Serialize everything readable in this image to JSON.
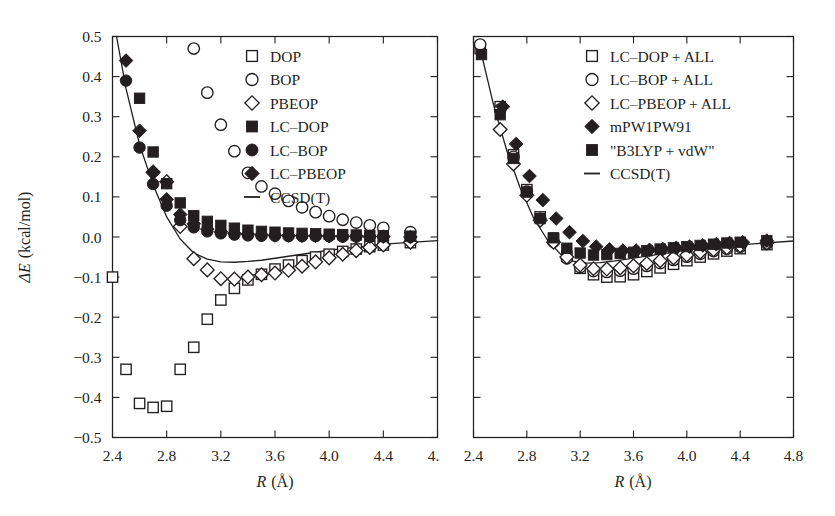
{
  "figure": {
    "background": "#ffffff",
    "ink": "#231f20",
    "panels": [
      "left",
      "right"
    ]
  },
  "chart_data": [
    {
      "id": "left",
      "type": "scatter",
      "title": "",
      "xlabel": "R (Å)",
      "ylabel": "ΔE (kcal/mol)",
      "xlim": [
        2.4,
        4.8
      ],
      "ylim": [
        -0.5,
        0.5
      ],
      "xticks": [
        "2.4",
        "2.8",
        "3.2",
        "3.6",
        "4.0",
        "4.4",
        "4.8"
      ],
      "xtick_values": [
        2.4,
        2.8,
        3.2,
        3.6,
        4.0,
        4.4,
        4.8
      ],
      "yticks": [
        "0.5",
        "0.4",
        "0.3",
        "0.2",
        "0.1",
        "0.0",
        "−0.1",
        "−0.2",
        "−0.3",
        "−0.4",
        "−0.5"
      ],
      "ytick_values": [
        0.5,
        0.4,
        0.3,
        0.2,
        0.1,
        0.0,
        -0.1,
        -0.2,
        -0.3,
        -0.4,
        -0.5
      ],
      "grid": false,
      "legend_position": "upper-right",
      "series": [
        {
          "name": "DOP",
          "marker": "square-open",
          "x": [
            2.4,
            2.5,
            2.6,
            2.7,
            2.8,
            2.9,
            3.0,
            3.1,
            3.2,
            3.3,
            3.4,
            3.5,
            3.6,
            3.7,
            3.8,
            3.9,
            4.0,
            4.1,
            4.2,
            4.3,
            4.4,
            4.6
          ],
          "y": [
            -0.1,
            -0.33,
            -0.415,
            -0.425,
            -0.422,
            -0.33,
            -0.275,
            -0.205,
            -0.157,
            -0.128,
            -0.107,
            -0.093,
            -0.08,
            -0.07,
            -0.059,
            -0.05,
            -0.043,
            -0.036,
            -0.03,
            -0.024,
            -0.02,
            -0.014
          ]
        },
        {
          "name": "BOP",
          "marker": "circle-open",
          "x": [
            3.0,
            3.1,
            3.2,
            3.3,
            3.4,
            3.5,
            3.6,
            3.7,
            3.8,
            3.9,
            4.0,
            4.1,
            4.2,
            4.3,
            4.4,
            4.6
          ],
          "y": [
            0.47,
            0.36,
            0.28,
            0.214,
            0.16,
            0.126,
            0.108,
            0.09,
            0.074,
            0.062,
            0.052,
            0.043,
            0.036,
            0.029,
            0.023,
            0.012
          ]
        },
        {
          "name": "PBEOP",
          "marker": "diamond-open",
          "x": [
            2.7,
            2.8,
            2.9,
            3.0,
            3.1,
            3.2,
            3.3,
            3.4,
            3.5,
            3.6,
            3.7,
            3.8,
            3.9,
            4.0,
            4.1,
            4.2,
            4.3,
            4.4,
            4.6
          ],
          "y": [
            0.162,
            0.138,
            0.026,
            -0.054,
            -0.082,
            -0.104,
            -0.105,
            -0.1,
            -0.094,
            -0.09,
            -0.083,
            -0.073,
            -0.062,
            -0.052,
            -0.043,
            -0.034,
            -0.026,
            -0.02,
            -0.013
          ]
        },
        {
          "name": "LC–DOP",
          "marker": "square-filled",
          "x": [
            2.6,
            2.7,
            2.8,
            2.9,
            3.0,
            3.1,
            3.2,
            3.3,
            3.4,
            3.5,
            3.6,
            3.7,
            3.8,
            3.9,
            4.0,
            4.1,
            4.2,
            4.3,
            4.4,
            4.6
          ],
          "y": [
            0.346,
            0.212,
            0.133,
            0.085,
            0.053,
            0.039,
            0.029,
            0.022,
            0.017,
            0.014,
            0.012,
            0.01,
            0.009,
            0.008,
            0.007,
            0.006,
            0.005,
            0.004,
            0.003,
            0.002
          ]
        },
        {
          "name": "LC–BOP",
          "marker": "circle-filled",
          "x": [
            2.5,
            2.6,
            2.7,
            2.8,
            2.9,
            3.0,
            3.1,
            3.2,
            3.3,
            3.4,
            3.5,
            3.6,
            3.7,
            3.8,
            3.9,
            4.0,
            4.1,
            4.2,
            4.3,
            4.4,
            4.6
          ],
          "y": [
            0.39,
            0.223,
            0.132,
            0.078,
            0.042,
            0.024,
            0.014,
            0.009,
            0.006,
            0.004,
            0.003,
            0.003,
            0.002,
            0.002,
            0.002,
            0.002,
            0.001,
            0.001,
            0.001,
            0.001,
            0.0
          ]
        },
        {
          "name": "LC–PBEOP",
          "marker": "diamond-filled",
          "x": [
            2.5,
            2.6,
            2.7,
            2.8,
            2.9,
            3.0,
            3.1,
            3.2,
            3.3,
            3.4,
            3.5,
            3.6,
            3.7,
            3.8,
            3.9,
            4.0,
            4.1,
            4.2,
            4.3,
            4.4,
            4.6
          ],
          "y": [
            0.44,
            0.265,
            0.16,
            0.094,
            0.056,
            0.033,
            0.02,
            0.013,
            0.009,
            0.007,
            0.005,
            0.004,
            0.004,
            0.003,
            0.003,
            0.002,
            0.002,
            0.002,
            0.001,
            0.001,
            0.0
          ]
        },
        {
          "name": "CCSD(T)",
          "marker": "line",
          "x": [
            2.43,
            2.5,
            2.6,
            2.7,
            2.8,
            2.9,
            3.0,
            3.1,
            3.2,
            3.3,
            3.4,
            3.5,
            3.6,
            3.7,
            3.8,
            3.9,
            4.0,
            4.2,
            4.4,
            4.8
          ],
          "y": [
            0.5,
            0.37,
            0.23,
            0.13,
            0.05,
            -0.005,
            -0.04,
            -0.055,
            -0.062,
            -0.063,
            -0.061,
            -0.058,
            -0.053,
            -0.048,
            -0.043,
            -0.038,
            -0.033,
            -0.025,
            -0.018,
            -0.009
          ]
        }
      ]
    },
    {
      "id": "right",
      "type": "scatter",
      "title": "",
      "xlabel": "R (Å)",
      "ylabel": "",
      "xlim": [
        2.4,
        4.8
      ],
      "ylim": [
        -0.5,
        0.5
      ],
      "xticks": [
        "2.4",
        "2.8",
        "3.2",
        "3.6",
        "4.0",
        "4.4",
        "4.8"
      ],
      "xtick_values": [
        2.4,
        2.8,
        3.2,
        3.6,
        4.0,
        4.4,
        4.8
      ],
      "ytick_values": [
        0.5,
        0.4,
        0.3,
        0.2,
        0.1,
        0.0,
        -0.1,
        -0.2,
        -0.3,
        -0.4,
        -0.5
      ],
      "grid": false,
      "legend_position": "upper-right",
      "series": [
        {
          "name": "LC–DOP + ALL",
          "marker": "square-open",
          "x": [
            2.45,
            2.6,
            2.7,
            2.8,
            2.9,
            3.0,
            3.1,
            3.2,
            3.3,
            3.4,
            3.5,
            3.6,
            3.7,
            3.8,
            3.9,
            4.0,
            4.1,
            4.2,
            4.3,
            4.4,
            4.6
          ],
          "y": [
            0.47,
            0.325,
            0.205,
            0.118,
            0.05,
            -0.005,
            -0.048,
            -0.078,
            -0.094,
            -0.1,
            -0.099,
            -0.094,
            -0.086,
            -0.077,
            -0.068,
            -0.059,
            -0.05,
            -0.042,
            -0.035,
            -0.029,
            -0.019
          ]
        },
        {
          "name": "LC–BOP + ALL",
          "marker": "circle-open",
          "x": [
            2.45,
            2.6,
            2.7,
            2.8,
            2.9,
            3.0,
            3.1,
            3.2,
            3.3,
            3.4,
            3.5,
            3.6,
            3.7,
            3.8,
            3.9,
            4.0,
            4.1,
            4.2,
            4.3,
            4.4,
            4.6
          ],
          "y": [
            0.48,
            0.318,
            0.2,
            0.113,
            0.045,
            -0.012,
            -0.053,
            -0.075,
            -0.085,
            -0.087,
            -0.084,
            -0.079,
            -0.072,
            -0.065,
            -0.057,
            -0.049,
            -0.042,
            -0.035,
            -0.029,
            -0.024,
            -0.016
          ]
        },
        {
          "name": "LC–PBEOP + ALL",
          "marker": "diamond-open",
          "x": [
            2.6,
            2.7,
            2.8,
            2.9,
            3.0,
            3.1,
            3.2,
            3.3,
            3.4,
            3.5,
            3.6,
            3.7,
            3.8,
            3.9,
            4.0,
            4.1,
            4.2,
            4.3,
            4.4,
            4.6
          ],
          "y": [
            0.268,
            0.182,
            0.104,
            0.042,
            -0.013,
            -0.05,
            -0.07,
            -0.079,
            -0.08,
            -0.077,
            -0.072,
            -0.066,
            -0.059,
            -0.052,
            -0.045,
            -0.038,
            -0.032,
            -0.027,
            -0.022,
            -0.015
          ]
        },
        {
          "name": "mPW1PW91",
          "marker": "diamond-filled",
          "x": [
            2.62,
            2.72,
            2.82,
            2.92,
            3.02,
            3.12,
            3.22,
            3.32,
            3.42,
            3.52,
            3.62,
            3.72,
            3.82,
            3.92,
            4.02,
            4.12,
            4.22,
            4.32,
            4.42,
            4.6
          ],
          "y": [
            0.325,
            0.232,
            0.152,
            0.092,
            0.046,
            0.012,
            -0.01,
            -0.024,
            -0.031,
            -0.034,
            -0.034,
            -0.032,
            -0.03,
            -0.027,
            -0.024,
            -0.021,
            -0.018,
            -0.015,
            -0.013,
            -0.009
          ]
        },
        {
          "name": "\"B3LYP + vdW\"",
          "marker": "square-filled",
          "x": [
            2.46,
            2.6,
            2.7,
            2.8,
            2.9,
            3.0,
            3.1,
            3.2,
            3.3,
            3.4,
            3.5,
            3.6,
            3.7,
            3.8,
            3.9,
            4.0,
            4.1,
            4.2,
            4.3,
            4.4,
            4.6
          ],
          "y": [
            0.455,
            0.305,
            0.196,
            0.112,
            0.046,
            -0.002,
            -0.028,
            -0.04,
            -0.045,
            -0.044,
            -0.041,
            -0.038,
            -0.034,
            -0.03,
            -0.027,
            -0.024,
            -0.021,
            -0.018,
            -0.015,
            -0.013,
            -0.009
          ]
        },
        {
          "name": "CCSD(T)",
          "marker": "line",
          "x": [
            2.45,
            2.55,
            2.65,
            2.75,
            2.85,
            2.95,
            3.05,
            3.15,
            3.25,
            3.35,
            3.45,
            3.55,
            3.65,
            3.75,
            3.85,
            3.95,
            4.1,
            4.3,
            4.5,
            4.8
          ],
          "y": [
            0.47,
            0.33,
            0.215,
            0.122,
            0.048,
            -0.005,
            -0.042,
            -0.06,
            -0.065,
            -0.064,
            -0.06,
            -0.055,
            -0.05,
            -0.045,
            -0.04,
            -0.035,
            -0.029,
            -0.022,
            -0.017,
            -0.01
          ]
        }
      ]
    }
  ],
  "left_panel": {
    "y_axis_label_delta": "ΔE",
    "y_axis_label_units": "(kcal/mol)",
    "x_axis_label_symbol": "R",
    "x_axis_label_units": "(Å)",
    "ytick_labels": [
      "0.5",
      "0.4",
      "0.3",
      "0.2",
      "0.1",
      "0.0",
      "−0.1",
      "−0.2",
      "−0.3",
      "−0.4",
      "−0.5"
    ],
    "xtick_labels": [
      "2.4",
      "2.8",
      "3.2",
      "3.6",
      "4.0",
      "4.4",
      "4.8"
    ],
    "legend": [
      {
        "label": "DOP",
        "marker": "square-open"
      },
      {
        "label": "BOP",
        "marker": "circle-open"
      },
      {
        "label": "PBEOP",
        "marker": "diamond-open"
      },
      {
        "label": "LC–DOP",
        "marker": "square-filled"
      },
      {
        "label": "LC–BOP",
        "marker": "circle-filled"
      },
      {
        "label": "LC–PBEOP",
        "marker": "diamond-filled"
      },
      {
        "label": "CCSD(T)",
        "marker": "line"
      }
    ]
  },
  "right_panel": {
    "x_axis_label_symbol": "R",
    "x_axis_label_units": "(Å)",
    "xtick_labels": [
      "2.4",
      "2.8",
      "3.2",
      "3.6",
      "4.0",
      "4.4",
      "4.8"
    ],
    "legend": [
      {
        "label": "LC–DOP + ALL",
        "marker": "square-open"
      },
      {
        "label": "LC–BOP + ALL",
        "marker": "circle-open"
      },
      {
        "label": "LC–PBEOP + ALL",
        "marker": "diamond-open"
      },
      {
        "label": "mPW1PW91",
        "marker": "diamond-filled"
      },
      {
        "label": "\"B3LYP + vdW\"",
        "marker": "square-filled"
      },
      {
        "label": "CCSD(T)",
        "marker": "line"
      }
    ]
  }
}
